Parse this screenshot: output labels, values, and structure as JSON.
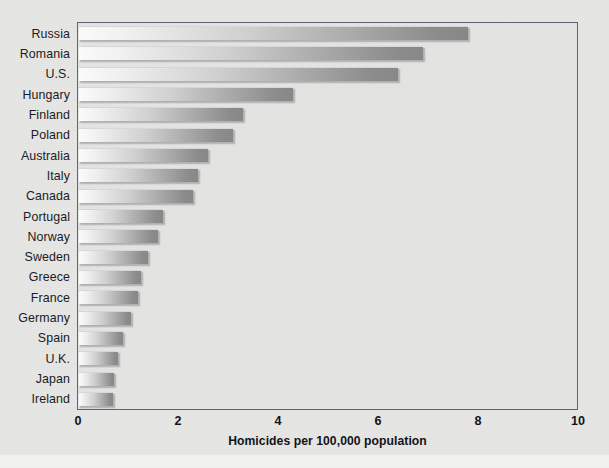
{
  "chart_data": {
    "type": "bar",
    "orientation": "horizontal",
    "title": "",
    "xlabel": "Homicides per 100,000 population",
    "ylabel": "",
    "xlim": [
      0,
      10
    ],
    "xticks": [
      "0",
      "2",
      "4",
      "6",
      "8",
      "10"
    ],
    "grid": false,
    "legend": null,
    "categories": [
      "Russia",
      "Romania",
      "U.S.",
      "Hungary",
      "Finland",
      "Poland",
      "Australia",
      "Italy",
      "Canada",
      "Portugal",
      "Norway",
      "Sweden",
      "Greece",
      "France",
      "Germany",
      "Spain",
      "U.K.",
      "Japan",
      "Ireland"
    ],
    "values": [
      7.8,
      6.9,
      6.4,
      4.3,
      3.3,
      3.1,
      2.6,
      2.4,
      2.3,
      1.7,
      1.6,
      1.4,
      1.25,
      1.2,
      1.05,
      0.9,
      0.8,
      0.72,
      0.7
    ]
  },
  "style": {
    "page_background": "#e6e6e4",
    "plot_background": "#e4e4e2",
    "frame_color": "#5e6470",
    "bar_gradient_start": "#fcfcfc",
    "bar_gradient_end": "#888888",
    "text_color": "#12121a"
  }
}
